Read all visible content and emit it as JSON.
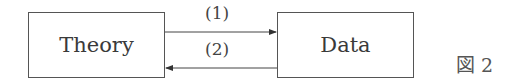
{
  "diagram": {
    "nodes": [
      {
        "id": "theory",
        "label": "Theory"
      },
      {
        "id": "data",
        "label": "Data"
      }
    ],
    "edges": [
      {
        "from": "theory",
        "to": "data",
        "label": "(1)"
      },
      {
        "from": "data",
        "to": "theory",
        "label": "(2)"
      }
    ],
    "figure_label": "図 2"
  }
}
